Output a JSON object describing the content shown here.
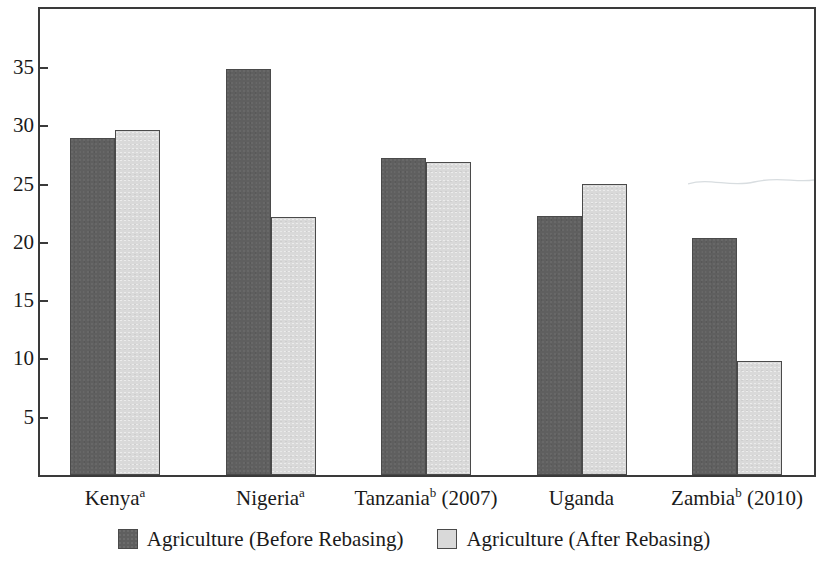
{
  "chart_data": {
    "type": "bar",
    "title": "",
    "subtitle": "",
    "xlabel": "",
    "ylabel": "",
    "ylim": [
      0,
      38.5
    ],
    "grid": false,
    "legend_position": "bottom-center",
    "categories": [
      "Kenyaᵃ",
      "Nigeriaᵃ",
      "Tanzaniaᵇ (2007)",
      "Uganda",
      "Zambiaᵇ (2010)"
    ],
    "category_parts": [
      {
        "name": "Kenya",
        "superscript": "a",
        "suffix": ""
      },
      {
        "name": "Nigeria",
        "superscript": "a",
        "suffix": ""
      },
      {
        "name": "Tanzania",
        "superscript": "b",
        "suffix": " (2007)"
      },
      {
        "name": "Uganda",
        "superscript": "",
        "suffix": ""
      },
      {
        "name": "Zambia",
        "superscript": "b",
        "suffix": " (2010)"
      }
    ],
    "series": [
      {
        "name": "Agriculture (Before Rebasing)",
        "color": "#5f5f5f",
        "values": [
          28.8,
          34.7,
          27.1,
          22.1,
          20.2
        ]
      },
      {
        "name": "Agriculture (After Rebasing)",
        "color": "#d9d9d9",
        "values": [
          29.5,
          22.0,
          26.8,
          24.9,
          9.7
        ]
      }
    ],
    "yticks": [
      5,
      10,
      15,
      20,
      25,
      30,
      35
    ],
    "ytick_labels": [
      "5",
      "10",
      "15",
      "20",
      "25",
      "30",
      "35"
    ]
  },
  "legend": {
    "items": [
      {
        "label": "Agriculture (Before Rebasing)",
        "swatch": "dark-gray-swatch"
      },
      {
        "label": "Agriculture (After Rebasing)",
        "swatch": "light-gray-swatch"
      }
    ]
  },
  "colors": {
    "series_before": "#5f5f5f",
    "series_after": "#d9d9d9",
    "axis": "#3a3a3a",
    "text": "#1a1a1a",
    "background": "#ffffff"
  }
}
